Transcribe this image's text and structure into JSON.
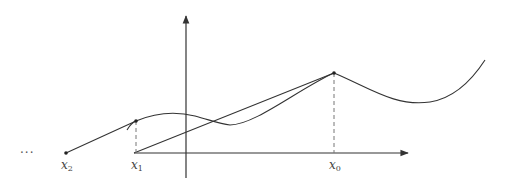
{
  "diagram": {
    "title": "",
    "labels": {
      "ellipsis": "···",
      "x2": {
        "base": "x",
        "sub": "2"
      },
      "x1": {
        "base": "x",
        "sub": "1"
      },
      "x0": {
        "base": "x",
        "sub": "0"
      }
    },
    "elements": [
      "x-axis with arrow",
      "y-axis with arrow",
      "curve f(x)",
      "tangent/secant line from x0 to x1 on axis",
      "segment from x1 point to x2 on axis",
      "dashed verticals at x1 and x0"
    ],
    "colors": {
      "stroke": "#333333",
      "dashed": "#777777",
      "text": "#444444"
    }
  }
}
